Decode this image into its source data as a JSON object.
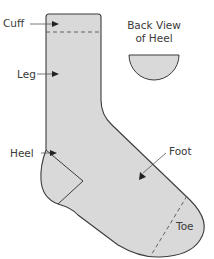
{
  "diagram": {
    "labels": {
      "cuff": "Cuff",
      "leg": "Leg",
      "heel": "Heel",
      "foot": "Foot",
      "toe": "Toe",
      "back_view_line1": "Back View",
      "back_view_line2": "of Heel"
    },
    "colors": {
      "fill": "#d9d9d9",
      "outline": "#3c3c3c",
      "text": "#3a3a3a"
    }
  }
}
